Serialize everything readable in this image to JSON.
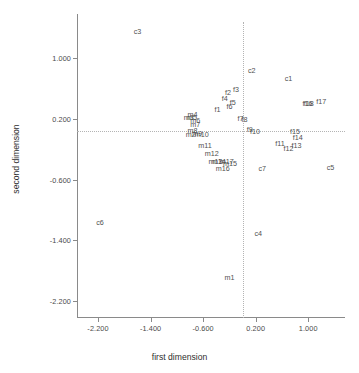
{
  "chart_data": {
    "type": "scatter",
    "title": "",
    "xlabel": "first dimension",
    "ylabel": "second dimension",
    "xlim": [
      -2.52,
      1.56
    ],
    "ylim": [
      -2.42,
      1.58
    ],
    "xticks": [
      "-2.200",
      "-1.400",
      "-0.600",
      "0.200",
      "1.000"
    ],
    "xtick_values": [
      -2.2,
      -1.4,
      -0.6,
      0.2,
      1.0
    ],
    "yticks": [
      "1.000",
      "0.200",
      "-0.600",
      "-1.400",
      "-2.200"
    ],
    "ytick_values": [
      1.0,
      0.2,
      -0.6,
      -1.4,
      -2.2
    ],
    "grid": false,
    "legend": "none",
    "reference_lines": {
      "vertical_x": 0.0,
      "horizontal_y": 0.04,
      "style": "dotted",
      "color": "#b4b4b4"
    },
    "marker_style": "text-label-only",
    "points": [
      {
        "label": "c3",
        "x": -1.6,
        "y": 1.36
      },
      {
        "label": "c2",
        "x": 0.14,
        "y": 0.84
      },
      {
        "label": "c1",
        "x": 0.7,
        "y": 0.74
      },
      {
        "label": "f2",
        "x": -0.22,
        "y": 0.56
      },
      {
        "label": "f3",
        "x": -0.1,
        "y": 0.59
      },
      {
        "label": "f4",
        "x": -0.27,
        "y": 0.47
      },
      {
        "label": "f5",
        "x": -0.15,
        "y": 0.42
      },
      {
        "label": "f6",
        "x": -0.2,
        "y": 0.37
      },
      {
        "label": "f1",
        "x": -0.38,
        "y": 0.33
      },
      {
        "label": "f16",
        "x": 0.99,
        "y": 0.41
      },
      {
        "label": "f18",
        "x": 1.01,
        "y": 0.41
      },
      {
        "label": "f17",
        "x": 1.2,
        "y": 0.44
      },
      {
        "label": "m4",
        "x": -0.76,
        "y": 0.26
      },
      {
        "label": "m3",
        "x": -0.82,
        "y": 0.22
      },
      {
        "label": "m5",
        "x": -0.77,
        "y": 0.22
      },
      {
        "label": "m6",
        "x": -0.72,
        "y": 0.19
      },
      {
        "label": "f7",
        "x": -0.03,
        "y": 0.21
      },
      {
        "label": "f8",
        "x": 0.03,
        "y": 0.2
      },
      {
        "label": "m7",
        "x": -0.72,
        "y": 0.13
      },
      {
        "label": "f9",
        "x": 0.11,
        "y": 0.07
      },
      {
        "label": "f10",
        "x": 0.19,
        "y": 0.04
      },
      {
        "label": "m8",
        "x": -0.76,
        "y": 0.05
      },
      {
        "label": "m2",
        "x": -0.79,
        "y": 0.0
      },
      {
        "label": "m9",
        "x": -0.69,
        "y": 0.01
      },
      {
        "label": "m10",
        "x": -0.62,
        "y": 0.0
      },
      {
        "label": "f15",
        "x": 0.8,
        "y": 0.04
      },
      {
        "label": "f14",
        "x": 0.84,
        "y": -0.04
      },
      {
        "label": "f11",
        "x": 0.57,
        "y": -0.12
      },
      {
        "label": "f13",
        "x": 0.82,
        "y": -0.14
      },
      {
        "label": "f12",
        "x": 0.7,
        "y": -0.18
      },
      {
        "label": "m11",
        "x": -0.57,
        "y": -0.14
      },
      {
        "label": "m12",
        "x": -0.47,
        "y": -0.25
      },
      {
        "label": "m13",
        "x": -0.41,
        "y": -0.35
      },
      {
        "label": "m14",
        "x": -0.36,
        "y": -0.35
      },
      {
        "label": "m17",
        "x": -0.24,
        "y": -0.35
      },
      {
        "label": "m15",
        "x": -0.19,
        "y": -0.38
      },
      {
        "label": "m16",
        "x": -0.3,
        "y": -0.45
      },
      {
        "label": "c7",
        "x": 0.3,
        "y": -0.44
      },
      {
        "label": "c5",
        "x": 1.34,
        "y": -0.43
      },
      {
        "label": "c6",
        "x": -2.17,
        "y": -1.16
      },
      {
        "label": "c4",
        "x": 0.24,
        "y": -1.3
      },
      {
        "label": "m1",
        "x": -0.2,
        "y": -1.88
      }
    ]
  },
  "axes": {
    "x_title": "first dimension",
    "y_title": "second dimension"
  }
}
